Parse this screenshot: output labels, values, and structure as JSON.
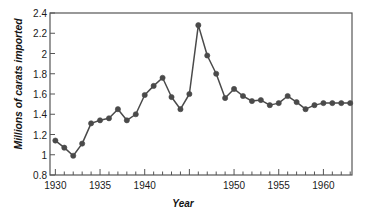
{
  "chart_data": {
    "type": "line",
    "title": "",
    "subtitle": "",
    "xlabel": "Year",
    "ylabel": "Millions of carats imported",
    "xlim": [
      1929.4,
      1963.2
    ],
    "ylim": [
      0.8,
      2.4
    ],
    "grid": false,
    "legend": null,
    "marker": "filled-circle",
    "series_color": "#4a4a4a",
    "y_ticks": [
      0.8,
      1,
      1.2,
      1.4,
      1.6,
      1.8,
      2,
      2.2,
      2.4
    ],
    "y_tick_labels": [
      "0.8",
      "1",
      "1.2",
      "1.4",
      "1.6",
      "1.8",
      "2",
      "2.2",
      "2.4"
    ],
    "x_ticks": [
      1930,
      1931,
      1932,
      1933,
      1934,
      1935,
      1936,
      1937,
      1938,
      1939,
      1940,
      1941,
      1942,
      1943,
      1944,
      1945,
      1946,
      1947,
      1948,
      1949,
      1950,
      1951,
      1952,
      1953,
      1954,
      1955,
      1956,
      1957,
      1958,
      1959,
      1960,
      1961,
      1962,
      1963
    ],
    "x_tick_labels": [
      "1930",
      "1935",
      "1940",
      "1950",
      "1955",
      "1960"
    ],
    "x_labeled_ticks": [
      1930,
      1935,
      1940,
      1950,
      1955,
      1960
    ],
    "series": [
      {
        "name": "Carats imported",
        "x": [
          1930,
          1931,
          1932,
          1933,
          1934,
          1935,
          1936,
          1937,
          1938,
          1939,
          1940,
          1941,
          1942,
          1943,
          1944,
          1945,
          1946,
          1947,
          1948,
          1949,
          1950,
          1951,
          1952,
          1953,
          1954,
          1955,
          1956,
          1957,
          1958,
          1959,
          1960,
          1961,
          1962,
          1963
        ],
        "values": [
          1.14,
          1.07,
          0.99,
          1.11,
          1.31,
          1.34,
          1.36,
          1.45,
          1.34,
          1.4,
          1.59,
          1.68,
          1.76,
          1.57,
          1.45,
          1.6,
          2.28,
          1.98,
          1.8,
          1.56,
          1.65,
          1.58,
          1.53,
          1.54,
          1.49,
          1.51,
          1.58,
          1.52,
          1.45,
          1.49,
          1.51,
          1.51,
          1.51,
          1.51
        ]
      }
    ],
    "points": [
      {
        "year": 1930,
        "value": 1.14
      },
      {
        "year": 1931,
        "value": 1.07
      },
      {
        "year": 1932,
        "value": 0.99
      },
      {
        "year": 1933,
        "value": 1.11
      },
      {
        "year": 1934,
        "value": 1.31
      },
      {
        "year": 1935,
        "value": 1.34
      },
      {
        "year": 1936,
        "value": 1.36
      },
      {
        "year": 1937,
        "value": 1.45
      },
      {
        "year": 1938,
        "value": 1.34
      },
      {
        "year": 1939,
        "value": 1.4
      },
      {
        "year": 1940,
        "value": 1.59
      },
      {
        "year": 1941,
        "value": 1.68
      },
      {
        "year": 1942,
        "value": 1.76
      },
      {
        "year": 1943,
        "value": 1.57
      },
      {
        "year": 1944,
        "value": 1.45
      },
      {
        "year": 1945,
        "value": 1.6
      },
      {
        "year": 1946,
        "value": 2.28
      },
      {
        "year": 1947,
        "value": 1.98
      },
      {
        "year": 1948,
        "value": 1.8
      },
      {
        "year": 1949,
        "value": 1.56
      },
      {
        "year": 1950,
        "value": 1.65
      },
      {
        "year": 1951,
        "value": 1.58
      },
      {
        "year": 1952,
        "value": 1.53
      },
      {
        "year": 1953,
        "value": 1.54
      },
      {
        "year": 1954,
        "value": 1.49
      },
      {
        "year": 1955,
        "value": 1.51
      },
      {
        "year": 1956,
        "value": 1.58
      },
      {
        "year": 1957,
        "value": 1.52
      },
      {
        "year": 1958,
        "value": 1.45
      },
      {
        "year": 1959,
        "value": 1.49
      },
      {
        "year": 1960,
        "value": 1.51
      },
      {
        "year": 1961,
        "value": 1.51
      },
      {
        "year": 1962,
        "value": 1.51
      },
      {
        "year": 1963,
        "value": 1.51
      }
    ]
  },
  "axis": {
    "frame_color": "#555555",
    "text_color": "#1a1a1a"
  }
}
